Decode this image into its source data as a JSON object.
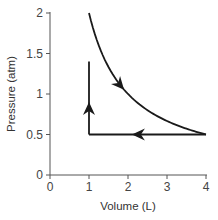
{
  "chart_data": {
    "type": "line",
    "title": "",
    "xlabel": "Volume (L)",
    "ylabel": "Pressure (atm)",
    "xlim": [
      0,
      4
    ],
    "ylim": [
      0,
      2
    ],
    "x_ticks": [
      0,
      1,
      2,
      3,
      4
    ],
    "x_tick_labels": [
      "0",
      "1",
      "2",
      "3",
      "4"
    ],
    "y_ticks": [
      0,
      0.5,
      1,
      1.5,
      2
    ],
    "y_tick_labels": [
      "0",
      "0.5",
      "1",
      "1.5",
      "2"
    ],
    "grid": false,
    "legend": null,
    "series": [
      {
        "name": "isothermal expansion (PV = 2)",
        "x": [
          1,
          1.25,
          1.5,
          1.75,
          2,
          2.5,
          3,
          3.5,
          4
        ],
        "y": [
          2,
          1.6,
          1.333,
          1.143,
          1,
          0.8,
          0.667,
          0.571,
          0.5
        ],
        "arrow_at": {
          "x": 1.9,
          "direction": "down-right"
        }
      },
      {
        "name": "isobaric compression",
        "x": [
          4,
          1
        ],
        "y": [
          0.5,
          0.5
        ],
        "arrow_at": {
          "x": 2.1,
          "direction": "left"
        }
      },
      {
        "name": "isochoric pressure increase",
        "x": [
          1,
          1
        ],
        "y": [
          0.5,
          1.4
        ],
        "arrow_at": {
          "y": 0.9,
          "direction": "up"
        }
      }
    ],
    "line_color": "#1a1a1a",
    "axis_color": "#555555"
  }
}
